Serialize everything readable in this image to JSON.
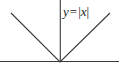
{
  "figure": {
    "name": "absolute-value-graph",
    "width": 119,
    "height": 70,
    "background_color": "#ffffff",
    "line_color": "#3a3a3a",
    "text_color": "#1a1a1a",
    "label": {
      "full_text": "y = |x|",
      "lhs_variable": "y",
      "operator": "=",
      "bar_left": "|",
      "rhs_variable": "x",
      "bar_right": "|"
    }
  },
  "chart_data": {
    "type": "line",
    "title": "",
    "subtitle": "",
    "xlabel": "",
    "ylabel": "",
    "annotations": [
      "y = |x|"
    ],
    "legend": [],
    "legend_position": "none",
    "grid": false,
    "axes": {
      "x_axis": {
        "orientation": "horizontal",
        "pixel_y": 61,
        "pixel_x_start": 0,
        "pixel_x_end": 119,
        "tick_labels": [],
        "visible": true
      },
      "y_axis": {
        "orientation": "vertical",
        "pixel_x": 60,
        "pixel_y_start": 0,
        "pixel_y_end": 62,
        "tick_labels": [],
        "visible": true
      }
    },
    "origin_pixel": [
      60,
      61
    ],
    "xlim": [
      -49,
      49
    ],
    "ylim": [
      0,
      49
    ],
    "series": [
      {
        "name": "y = |x|",
        "x": [
          -49,
          0,
          49
        ],
        "values": [
          49,
          0,
          49
        ],
        "pixel_points": [
          [
            11,
            13
          ],
          [
            60,
            62
          ],
          [
            110,
            13
          ]
        ],
        "color": "#3a3a3a"
      }
    ]
  }
}
